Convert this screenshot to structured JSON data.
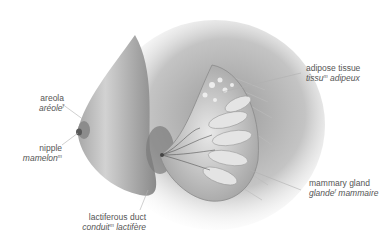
{
  "figure": {
    "labels": [
      {
        "id": "areola",
        "en": "areola",
        "fr": "aréole",
        "fr_gender": "f"
      },
      {
        "id": "nipple",
        "en": "nipple",
        "fr": "mamelon",
        "fr_gender": "m"
      },
      {
        "id": "adipose",
        "en": "adipose tissue",
        "fr_noun": "tissu",
        "fr_gender": "m",
        "fr_adj": "adipeux"
      },
      {
        "id": "gland",
        "en": "mammary gland",
        "fr_noun": "glande",
        "fr_gender": "f",
        "fr_adj": "mammaire"
      },
      {
        "id": "duct",
        "en": "lactiferous duct",
        "fr_noun": "conduit",
        "fr_gender": "m",
        "fr_adj": "lactifère"
      }
    ]
  },
  "colors": {
    "text": "#555555",
    "leader": "#b0b0b0",
    "skin_light": "#e6e6e6",
    "skin_dark": "#6a6a6a",
    "gland": "#d8d8d8"
  }
}
